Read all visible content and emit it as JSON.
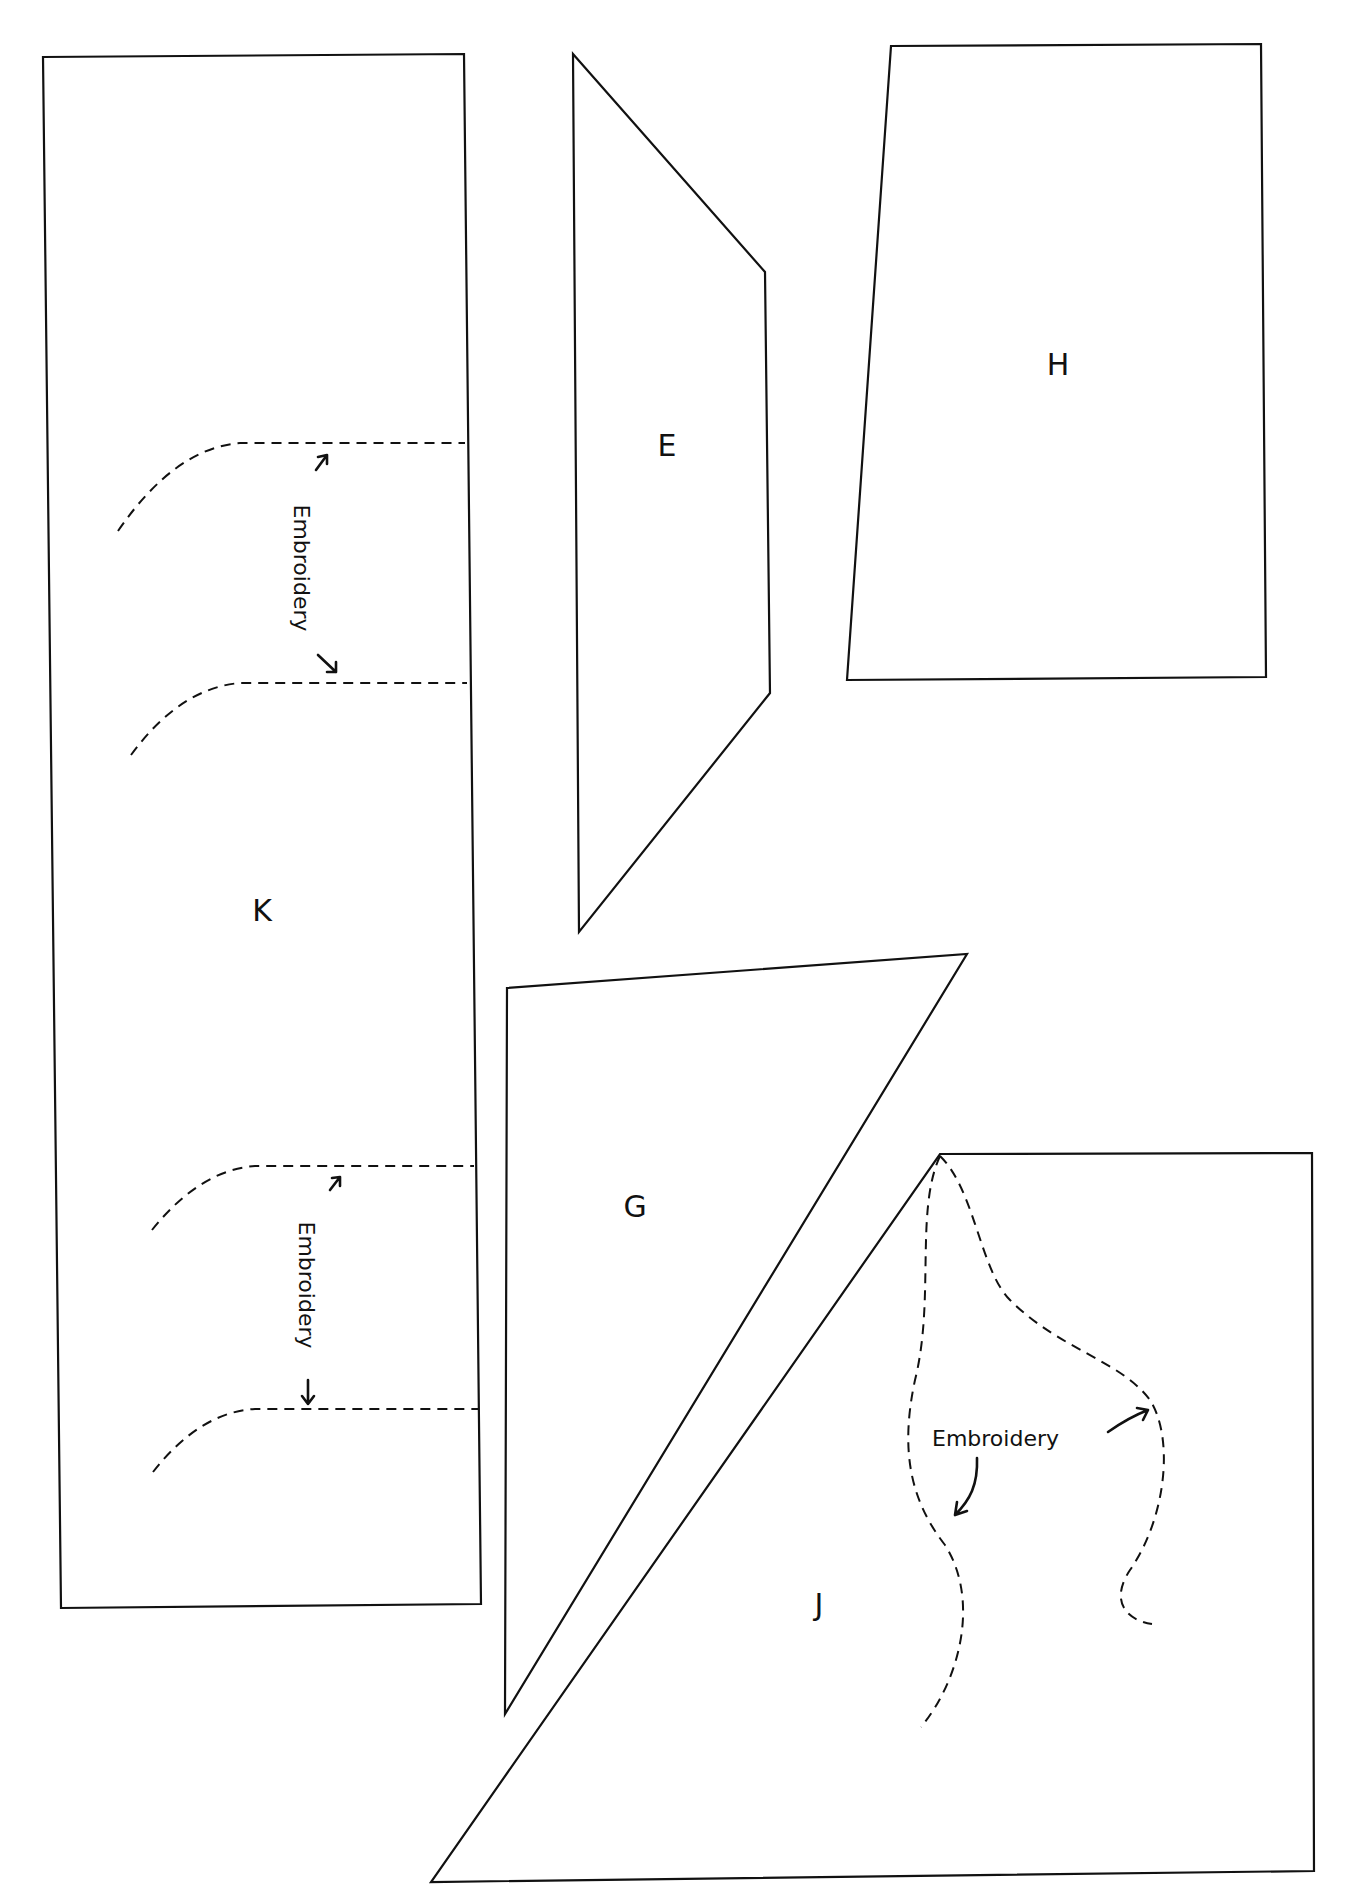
{
  "diagram": {
    "type": "sewing-pattern-pieces",
    "pieces": [
      {
        "id": "K",
        "label": "K"
      },
      {
        "id": "E",
        "label": "E"
      },
      {
        "id": "H",
        "label": "H"
      },
      {
        "id": "G",
        "label": "G"
      },
      {
        "id": "J",
        "label": "J"
      }
    ],
    "annotations": {
      "k_top": "Embroidery",
      "k_bottom": "Embroidery",
      "j": "Embroidery"
    }
  }
}
